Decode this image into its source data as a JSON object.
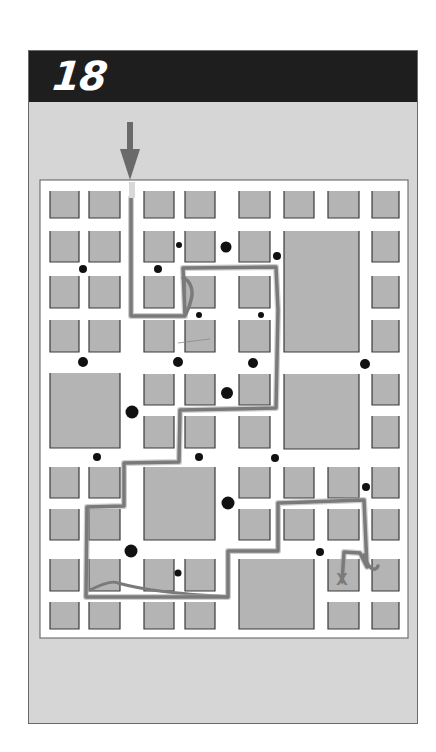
{
  "header": {
    "puzzle_number": "18",
    "background_color": "#1e1e1e",
    "text_color": "#ffffff"
  },
  "colors": {
    "panel": "#d6d6d6",
    "map_background": "#ffffff",
    "block_fill": "#b4b4b4",
    "block_border": "#3a3a3a",
    "dot": "#111111",
    "arrow": "#6a6a6a",
    "path": "#7a7a7a",
    "path_light": "#a8a8a8",
    "start_marker": "#d8d8d8",
    "goal_marker": "#7a7a7a"
  },
  "map": {
    "frame": {
      "x": 40,
      "y": 180,
      "w": 368,
      "h": 458
    },
    "blocks": [
      {
        "x": 50,
        "y": 191,
        "w": 29,
        "h": 27
      },
      {
        "x": 89,
        "y": 191,
        "w": 31,
        "h": 27
      },
      {
        "x": 144,
        "y": 191,
        "w": 30,
        "h": 27
      },
      {
        "x": 185,
        "y": 191,
        "w": 30,
        "h": 27
      },
      {
        "x": 239,
        "y": 191,
        "w": 31,
        "h": 27
      },
      {
        "x": 284,
        "y": 191,
        "w": 30,
        "h": 27
      },
      {
        "x": 328,
        "y": 191,
        "w": 31,
        "h": 27
      },
      {
        "x": 372,
        "y": 191,
        "w": 27,
        "h": 27
      },
      {
        "x": 50,
        "y": 231,
        "w": 29,
        "h": 31
      },
      {
        "x": 89,
        "y": 231,
        "w": 31,
        "h": 31
      },
      {
        "x": 144,
        "y": 231,
        "w": 30,
        "h": 31
      },
      {
        "x": 185,
        "y": 231,
        "w": 30,
        "h": 31
      },
      {
        "x": 239,
        "y": 231,
        "w": 31,
        "h": 31
      },
      {
        "x": 284,
        "y": 231,
        "w": 75,
        "h": 121
      },
      {
        "x": 372,
        "y": 231,
        "w": 27,
        "h": 31
      },
      {
        "x": 50,
        "y": 276,
        "w": 29,
        "h": 32
      },
      {
        "x": 89,
        "y": 276,
        "w": 31,
        "h": 32
      },
      {
        "x": 144,
        "y": 276,
        "w": 30,
        "h": 32
      },
      {
        "x": 185,
        "y": 276,
        "w": 30,
        "h": 32
      },
      {
        "x": 239,
        "y": 276,
        "w": 31,
        "h": 32
      },
      {
        "x": 372,
        "y": 276,
        "w": 27,
        "h": 32
      },
      {
        "x": 50,
        "y": 320,
        "w": 29,
        "h": 32
      },
      {
        "x": 89,
        "y": 320,
        "w": 31,
        "h": 32
      },
      {
        "x": 144,
        "y": 320,
        "w": 30,
        "h": 32
      },
      {
        "x": 185,
        "y": 320,
        "w": 30,
        "h": 32
      },
      {
        "x": 239,
        "y": 320,
        "w": 31,
        "h": 32
      },
      {
        "x": 372,
        "y": 320,
        "w": 27,
        "h": 32
      },
      {
        "x": 50,
        "y": 373,
        "w": 70,
        "h": 75
      },
      {
        "x": 144,
        "y": 374,
        "w": 30,
        "h": 31
      },
      {
        "x": 185,
        "y": 374,
        "w": 30,
        "h": 31
      },
      {
        "x": 239,
        "y": 374,
        "w": 31,
        "h": 31
      },
      {
        "x": 284,
        "y": 374,
        "w": 75,
        "h": 75
      },
      {
        "x": 372,
        "y": 374,
        "w": 27,
        "h": 31
      },
      {
        "x": 144,
        "y": 416,
        "w": 30,
        "h": 32
      },
      {
        "x": 185,
        "y": 416,
        "w": 30,
        "h": 32
      },
      {
        "x": 239,
        "y": 416,
        "w": 31,
        "h": 32
      },
      {
        "x": 372,
        "y": 416,
        "w": 27,
        "h": 32
      },
      {
        "x": 50,
        "y": 467,
        "w": 29,
        "h": 31
      },
      {
        "x": 89,
        "y": 467,
        "w": 31,
        "h": 31
      },
      {
        "x": 144,
        "y": 467,
        "w": 71,
        "h": 73
      },
      {
        "x": 239,
        "y": 467,
        "w": 31,
        "h": 31
      },
      {
        "x": 284,
        "y": 467,
        "w": 30,
        "h": 31
      },
      {
        "x": 328,
        "y": 467,
        "w": 31,
        "h": 31
      },
      {
        "x": 372,
        "y": 467,
        "w": 27,
        "h": 31
      },
      {
        "x": 50,
        "y": 509,
        "w": 29,
        "h": 31
      },
      {
        "x": 89,
        "y": 509,
        "w": 31,
        "h": 31
      },
      {
        "x": 239,
        "y": 509,
        "w": 31,
        "h": 31
      },
      {
        "x": 284,
        "y": 509,
        "w": 30,
        "h": 31
      },
      {
        "x": 328,
        "y": 509,
        "w": 31,
        "h": 31
      },
      {
        "x": 372,
        "y": 509,
        "w": 27,
        "h": 31
      },
      {
        "x": 50,
        "y": 559,
        "w": 29,
        "h": 32
      },
      {
        "x": 89,
        "y": 559,
        "w": 31,
        "h": 32
      },
      {
        "x": 144,
        "y": 559,
        "w": 30,
        "h": 32
      },
      {
        "x": 185,
        "y": 559,
        "w": 30,
        "h": 32
      },
      {
        "x": 239,
        "y": 559,
        "w": 75,
        "h": 70
      },
      {
        "x": 328,
        "y": 559,
        "w": 31,
        "h": 32
      },
      {
        "x": 372,
        "y": 559,
        "w": 27,
        "h": 32
      },
      {
        "x": 50,
        "y": 602,
        "w": 29,
        "h": 27
      },
      {
        "x": 89,
        "y": 602,
        "w": 31,
        "h": 27
      },
      {
        "x": 144,
        "y": 602,
        "w": 30,
        "h": 27
      },
      {
        "x": 185,
        "y": 602,
        "w": 30,
        "h": 27
      },
      {
        "x": 328,
        "y": 602,
        "w": 31,
        "h": 27
      },
      {
        "x": 372,
        "y": 602,
        "w": 27,
        "h": 27
      }
    ],
    "dots": [
      {
        "x": 179,
        "y": 245,
        "r": 3
      },
      {
        "x": 226,
        "y": 247,
        "r": 5.5
      },
      {
        "x": 277,
        "y": 256,
        "r": 4
      },
      {
        "x": 83,
        "y": 269,
        "r": 4
      },
      {
        "x": 158,
        "y": 269,
        "r": 4
      },
      {
        "x": 199,
        "y": 315,
        "r": 3
      },
      {
        "x": 261,
        "y": 315,
        "r": 3
      },
      {
        "x": 83,
        "y": 362,
        "r": 5
      },
      {
        "x": 178,
        "y": 362,
        "r": 5
      },
      {
        "x": 253,
        "y": 363,
        "r": 5
      },
      {
        "x": 365,
        "y": 364,
        "r": 5
      },
      {
        "x": 227,
        "y": 393,
        "r": 6
      },
      {
        "x": 132,
        "y": 412,
        "r": 6.5
      },
      {
        "x": 97,
        "y": 457,
        "r": 4
      },
      {
        "x": 199,
        "y": 457,
        "r": 4
      },
      {
        "x": 275,
        "y": 458,
        "r": 4
      },
      {
        "x": 366,
        "y": 487,
        "r": 4
      },
      {
        "x": 228,
        "y": 503,
        "r": 6.5
      },
      {
        "x": 131,
        "y": 551,
        "r": 6.5
      },
      {
        "x": 320,
        "y": 552,
        "r": 4
      },
      {
        "x": 178,
        "y": 573,
        "r": 3.5
      }
    ],
    "start_arrow": {
      "x": 130,
      "y_top": 122,
      "y_tip": 180,
      "label": "start"
    },
    "start_marker": {
      "x": 129,
      "y": 182,
      "w": 6,
      "h": 16
    },
    "route": "M131,198 L131,316 L185,316 L183,268 L276,267 L278,310 L276,408 L180,410 L179,462 L124,463 L124,506 L87,507 L86,597 L228,597 L228,551 L278,551 L278,503 L364,500 L367,567 L360,553 L344,552 L342,582",
    "route_alt": "M90,590 C100,585 112,580 118,583 C150,592 190,594 228,597",
    "route_loop": "M183,278 C190,280 194,290 191,300 C190,305 188,310 186,314",
    "route_hook": "M364,555 C368,570 376,572 378,566",
    "stray_line": {
      "x1": 178,
      "y1": 343,
      "x2": 210,
      "y2": 339
    },
    "goal": {
      "x": 342,
      "y": 585,
      "label": "X"
    }
  }
}
